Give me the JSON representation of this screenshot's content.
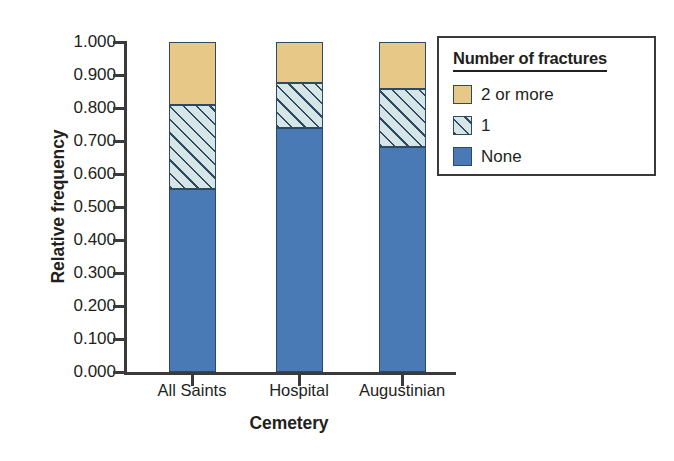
{
  "chart_data": {
    "type": "bar",
    "subtype": "stacked-bar",
    "title": "",
    "xlabel": "Cemetery",
    "ylabel": "Relative frequency",
    "categories": [
      "All Saints",
      "Hospital",
      "Augustinian"
    ],
    "series": [
      {
        "name": "None",
        "values": [
          0.555,
          0.739,
          0.682
        ],
        "color": "#4a7ab5",
        "fill": "solid"
      },
      {
        "name": "1",
        "values": [
          0.254,
          0.137,
          0.176
        ],
        "color": "#d6e5e5",
        "fill": "diagonal-hatch"
      },
      {
        "name": "2 or more",
        "values": [
          0.191,
          0.124,
          0.142
        ],
        "color": "#e8c887",
        "fill": "solid"
      }
    ],
    "cumulative_tops": {
      "All Saints": [
        0.555,
        0.809,
        1.0
      ],
      "Hospital": [
        0.739,
        0.876,
        1.0
      ],
      "Augustinian": [
        0.682,
        0.858,
        1.0
      ]
    },
    "ylim": [
      0.0,
      1.0
    ],
    "ytick_step": 0.1,
    "ytick_labels": [
      "1.000",
      "0.900",
      "0.800",
      "0.700",
      "0.600",
      "0.500",
      "0.400",
      "0.300",
      "0.200",
      "0.100",
      "0.000"
    ],
    "ytick_values": [
      1.0,
      0.9,
      0.8,
      0.7,
      0.6,
      0.5,
      0.4,
      0.3,
      0.2,
      0.1,
      0.0
    ],
    "grid": false,
    "legend_position": "top-right"
  },
  "legend": {
    "title": "Number of fractures",
    "items": [
      {
        "label": "2 or more",
        "swatch": "tan-solid"
      },
      {
        "label": "1",
        "swatch": "hatched"
      },
      {
        "label": "None",
        "swatch": "blue-solid"
      }
    ]
  },
  "colors": {
    "none": "#4a7ab5",
    "one_fill": "#d6e5e5",
    "one_hatch": "#2e4a63",
    "two_or_more": "#e8c887",
    "outline": "#2e4a63",
    "axis": "#3a3a3a",
    "text": "#231f20",
    "background": "#ffffff"
  }
}
